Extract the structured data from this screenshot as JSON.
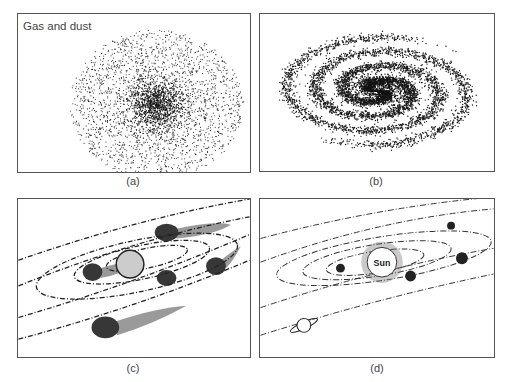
{
  "figure": {
    "panels": [
      {
        "id": "a",
        "caption": "(a)",
        "label": "Gas and dust",
        "description": "Diffuse cloud of gas and dust, denser toward the center"
      },
      {
        "id": "b",
        "caption": "(b)",
        "description": "Rotating cloud flattened into a spiral disk"
      },
      {
        "id": "c",
        "caption": "(c)",
        "description": "Protosun at center with clumps condensing along orbital rings"
      },
      {
        "id": "d",
        "caption": "(d)",
        "center_label": "Sun",
        "description": "Formed solar system with planets on elliptical orbits, including a ringed planet"
      }
    ],
    "colors": {
      "ink": "#222222",
      "border": "#555555",
      "sun_fill": "#cccccc",
      "background": "#ffffff"
    }
  }
}
